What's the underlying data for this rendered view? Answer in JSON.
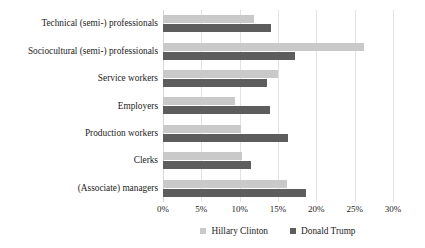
{
  "chart_data": {
    "type": "bar",
    "orientation": "horizontal",
    "title": "",
    "xlabel": "",
    "ylabel": "",
    "xlim": [
      0,
      30
    ],
    "xtick_labels": [
      "0%",
      "5%",
      "10%",
      "15%",
      "20%",
      "25%",
      "30%"
    ],
    "xtick_values": [
      0,
      5,
      10,
      15,
      20,
      25,
      30
    ],
    "grid": true,
    "legend_position": "bottom",
    "categories": [
      "Technical (semi-) professionals",
      "Sociocultural (semi-) professionals",
      "Service workers",
      "Employers",
      "Production workers",
      "Clerks",
      "(Associate) managers"
    ],
    "series": [
      {
        "name": "Hillary Clinton",
        "color": "#c9c9c9",
        "values": [
          11.9,
          26.2,
          15.0,
          9.4,
          10.2,
          10.3,
          16.2
        ]
      },
      {
        "name": "Donald Trump",
        "color": "#5d5d5d",
        "values": [
          14.1,
          17.2,
          13.5,
          14.0,
          16.3,
          11.5,
          18.6
        ]
      }
    ]
  },
  "legend": {
    "items": [
      {
        "label": "Hillary Clinton",
        "series": "clinton"
      },
      {
        "label": "Donald Trump",
        "series": "trump"
      }
    ]
  },
  "colors": {
    "clinton": "#c9c9c9",
    "trump": "#5d5d5d",
    "gridline": "#e2e2e2",
    "text": "#1c1c1c",
    "background": "#ffffff"
  }
}
